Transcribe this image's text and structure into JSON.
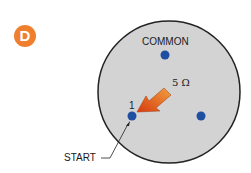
{
  "badge": {
    "letter": "D",
    "color": "#ef7f2e"
  },
  "diagram": {
    "disk_color": "#d3d3d3",
    "terminal_color": "#1f4fa0",
    "labels": {
      "common": "COMMON",
      "resistance": "5 Ω",
      "terminal_1": "1",
      "start": "START"
    }
  }
}
